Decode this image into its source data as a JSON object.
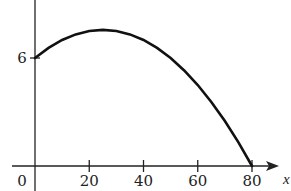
{
  "chart_data": {
    "type": "line",
    "title": "",
    "xlabel": "x",
    "ylabel": "",
    "x_ticks": [
      0,
      20,
      40,
      60,
      80
    ],
    "x_tick_labels": [
      "0",
      "20",
      "40",
      "60",
      "80"
    ],
    "y_ticks": [
      6
    ],
    "y_tick_labels": [
      "6"
    ],
    "xlim": [
      0,
      85
    ],
    "ylim": [
      0,
      9
    ],
    "grid": false,
    "legend": null,
    "series": [
      {
        "name": "curve",
        "description": "Concave-down parabola starting at (0,6), peaking near x=25 (y≈7.56), reaching 0 at x=80",
        "x": [
          0,
          5,
          10,
          15,
          20,
          25,
          30,
          35,
          40,
          45,
          50,
          55,
          60,
          65,
          70,
          75,
          80
        ],
        "y": [
          6,
          6.56,
          7.0,
          7.31,
          7.5,
          7.56,
          7.5,
          7.31,
          7.0,
          6.56,
          6.0,
          5.31,
          4.5,
          3.56,
          2.5,
          1.31,
          0
        ]
      }
    ]
  }
}
